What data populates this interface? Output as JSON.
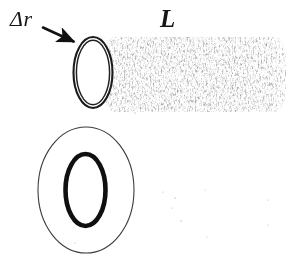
{
  "figure": {
    "background_color": "#ffffff",
    "ink_color": "#161616",
    "texture_color": "#4a4a4a",
    "width": 299,
    "height": 270
  },
  "labels": {
    "thickness": "Δr",
    "length": "L"
  },
  "upper_view": {
    "name": "tube-perspective-view",
    "mouth_ellipse": {
      "cx": 93,
      "cy": 72.5,
      "outer_rx": 19.5,
      "outer_ry": 35.5,
      "inner_rx": 16.5,
      "inner_ry": 32.0
    },
    "body": {
      "x": 104,
      "y": 37,
      "width": 182,
      "height": 75,
      "fill": "stipple-texture"
    },
    "annotation_arrow": {
      "from_x": 42,
      "from_y": 27,
      "to_x": 77,
      "to_y": 43
    }
  },
  "lower_view": {
    "name": "tube-cross-section-view",
    "outer_ellipse": {
      "cx": 86,
      "cy": 190,
      "rx": 48,
      "ry": 63,
      "stroke_width": 1.1
    },
    "inner_ellipse": {
      "cx": 85.5,
      "cy": 190,
      "rx": 20,
      "ry": 36,
      "stroke_width": 4.6
    }
  },
  "speckles": [
    {
      "x": 163,
      "y": 192,
      "r": 0.6
    },
    {
      "x": 175,
      "y": 198,
      "r": 0.7
    },
    {
      "x": 172,
      "y": 208,
      "r": 0.6
    },
    {
      "x": 181,
      "y": 221,
      "r": 0.7
    },
    {
      "x": 205,
      "y": 190,
      "r": 0.6
    },
    {
      "x": 207,
      "y": 237,
      "r": 0.6
    },
    {
      "x": 268,
      "y": 200,
      "r": 0.6
    },
    {
      "x": 268,
      "y": 225,
      "r": 0.6
    },
    {
      "x": 75,
      "y": 243,
      "r": 0.6
    },
    {
      "x": 135,
      "y": 113,
      "r": 0.7
    }
  ]
}
